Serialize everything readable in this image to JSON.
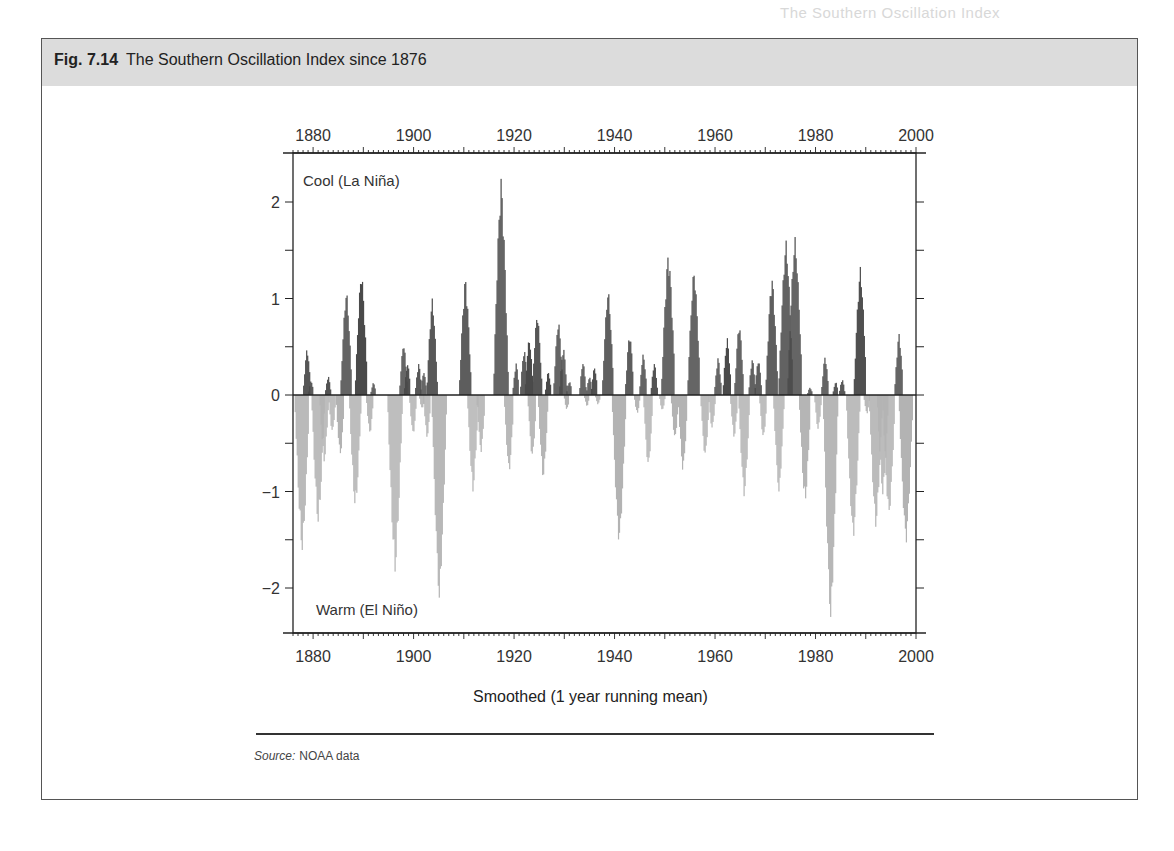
{
  "page": {
    "running_header": "The Southern Oscillation Index"
  },
  "figure": {
    "number": "Fig. 7.14",
    "title": "The Southern Oscillation Index since 1876",
    "caption": "Smoothed (1 year running mean)",
    "source_label": "Source:",
    "source_text": "NOAA data",
    "annotation_top": "Cool (La Niña)",
    "annotation_bottom": "Warm (El Niño)"
  },
  "colors": {
    "positive": "#4a4a4a",
    "negative": "#b3b3b3",
    "axis": "#222222",
    "header_band": "#dcdcdc"
  },
  "chart_data": {
    "type": "bar",
    "title": "The Southern Oscillation Index since 1876",
    "xlabel": "Smoothed (1 year running mean)",
    "ylabel": "",
    "xlim": [
      1876,
      2000
    ],
    "ylim": [
      -2.5,
      2.5
    ],
    "x_ticks": [
      1880,
      1900,
      1920,
      1940,
      1960,
      1980,
      2000
    ],
    "y_ticks": [
      -2,
      -1,
      0,
      1,
      2
    ],
    "y_tick_labels": [
      "−2",
      "−1",
      "0",
      "1",
      "2"
    ],
    "annotations": [
      "Cool (La Niña)",
      "Warm (El Niño)"
    ],
    "grid": false,
    "series": [
      {
        "name": "Positive SOI (La Niña)",
        "color": "#4a4a4a",
        "points": [
          [
            1878.8,
            0.49
          ],
          [
            1879.6,
            0.15
          ],
          [
            1883.0,
            0.2
          ],
          [
            1886.6,
            1.09
          ],
          [
            1889.6,
            1.29
          ],
          [
            1892.0,
            0.13
          ],
          [
            1898.0,
            0.55
          ],
          [
            1898.8,
            0.33
          ],
          [
            1901.0,
            0.33
          ],
          [
            1902.0,
            0.25
          ],
          [
            1903.7,
            1.0
          ],
          [
            1910.3,
            1.22
          ],
          [
            1917.4,
            2.24
          ],
          [
            1920.4,
            0.33
          ],
          [
            1922.0,
            0.48
          ],
          [
            1923.0,
            0.6
          ],
          [
            1924.6,
            0.86
          ],
          [
            1926.8,
            0.25
          ],
          [
            1928.8,
            0.78
          ],
          [
            1929.8,
            0.5
          ],
          [
            1931.0,
            0.15
          ],
          [
            1933.7,
            0.35
          ],
          [
            1935.0,
            0.2
          ],
          [
            1936.0,
            0.3
          ],
          [
            1938.7,
            1.1
          ],
          [
            1943.0,
            0.65
          ],
          [
            1945.7,
            0.43
          ],
          [
            1947.9,
            0.34
          ],
          [
            1950.7,
            1.49
          ],
          [
            1955.8,
            1.31
          ],
          [
            1960.6,
            0.39
          ],
          [
            1962.4,
            0.6
          ],
          [
            1964.8,
            0.75
          ],
          [
            1967.4,
            0.38
          ],
          [
            1968.6,
            0.38
          ],
          [
            1971.3,
            1.24
          ],
          [
            1974.1,
            1.61
          ],
          [
            1975.9,
            1.64
          ],
          [
            1978.9,
            0.08
          ],
          [
            1981.9,
            0.41
          ],
          [
            1984.0,
            0.14
          ],
          [
            1985.3,
            0.17
          ],
          [
            1988.9,
            1.33
          ],
          [
            1996.6,
            0.64
          ]
        ]
      },
      {
        "name": "Negative SOI (El Niño)",
        "color": "#b3b3b3",
        "points": [
          [
            1877.8,
            -1.63
          ],
          [
            1881.0,
            -1.35
          ],
          [
            1882.2,
            -0.7
          ],
          [
            1883.8,
            -0.4
          ],
          [
            1885.4,
            -0.64
          ],
          [
            1888.4,
            -1.19
          ],
          [
            1891.3,
            -0.41
          ],
          [
            1896.3,
            -1.83
          ],
          [
            1899.9,
            -0.42
          ],
          [
            1901.7,
            -0.15
          ],
          [
            1902.7,
            -0.45
          ],
          [
            1905.1,
            -2.1
          ],
          [
            1911.8,
            -1.0
          ],
          [
            1913.4,
            -0.6
          ],
          [
            1919.0,
            -0.81
          ],
          [
            1923.6,
            -0.66
          ],
          [
            1925.8,
            -0.88
          ],
          [
            1930.5,
            -0.16
          ],
          [
            1934.5,
            -0.12
          ],
          [
            1936.7,
            -0.1
          ],
          [
            1940.9,
            -1.55
          ],
          [
            1944.5,
            -0.2
          ],
          [
            1946.7,
            -0.76
          ],
          [
            1949.5,
            -0.17
          ],
          [
            1952.0,
            -0.47
          ],
          [
            1953.6,
            -0.8
          ],
          [
            1958.0,
            -0.65
          ],
          [
            1959.4,
            -0.36
          ],
          [
            1963.8,
            -0.45
          ],
          [
            1965.8,
            -1.06
          ],
          [
            1969.6,
            -0.46
          ],
          [
            1972.7,
            -1.0
          ],
          [
            1977.9,
            -1.14
          ],
          [
            1980.5,
            -0.37
          ],
          [
            1983.0,
            -2.3
          ],
          [
            1987.5,
            -1.5
          ],
          [
            1990.2,
            -0.2
          ],
          [
            1992.0,
            -1.38
          ],
          [
            1993.4,
            -1.05
          ],
          [
            1994.6,
            -1.27
          ],
          [
            1998.0,
            -1.55
          ]
        ]
      }
    ]
  }
}
